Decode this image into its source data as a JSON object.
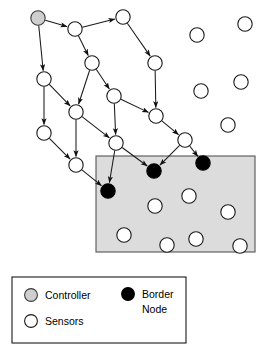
{
  "figure": {
    "background_color": "#ffffff",
    "stroke_color": "#1a1a1a"
  },
  "region": {
    "name": "monitored-region",
    "fill": "#dcdcdc",
    "stroke": "#555555",
    "x": 96,
    "y": 156,
    "width": 159,
    "height": 96
  },
  "node_style": {
    "controller_fill": "#cfcfcf",
    "sensor_fill": "#ffffff",
    "border_node_fill": "#000000",
    "radius": 7.2
  },
  "nodes": [
    {
      "id": "c1",
      "type": "controller",
      "x": 38,
      "y": 18
    },
    {
      "id": "n1",
      "type": "sensor",
      "x": 75,
      "y": 29
    },
    {
      "id": "n2",
      "type": "sensor",
      "x": 123,
      "y": 17
    },
    {
      "id": "n3",
      "type": "sensor",
      "x": 92,
      "y": 63
    },
    {
      "id": "n4",
      "type": "sensor",
      "x": 155,
      "y": 63
    },
    {
      "id": "n5",
      "type": "sensor",
      "x": 44,
      "y": 79
    },
    {
      "id": "n6",
      "type": "sensor",
      "x": 114,
      "y": 96
    },
    {
      "id": "n7",
      "type": "sensor",
      "x": 76,
      "y": 112
    },
    {
      "id": "n8",
      "type": "sensor",
      "x": 156,
      "y": 116
    },
    {
      "id": "n9",
      "type": "sensor",
      "x": 44,
      "y": 133
    },
    {
      "id": "n10",
      "type": "sensor",
      "x": 116,
      "y": 143
    },
    {
      "id": "n11",
      "type": "sensor",
      "x": 185,
      "y": 140
    },
    {
      "id": "n12",
      "type": "sensor",
      "x": 76,
      "y": 165
    },
    {
      "id": "b1",
      "type": "border",
      "x": 108,
      "y": 191
    },
    {
      "id": "b2",
      "type": "border",
      "x": 154,
      "y": 171
    },
    {
      "id": "b3",
      "type": "border",
      "x": 203,
      "y": 163
    },
    {
      "id": "s1",
      "type": "sensor",
      "x": 197,
      "y": 35
    },
    {
      "id": "s2",
      "type": "sensor",
      "x": 245,
      "y": 24
    },
    {
      "id": "s3",
      "type": "sensor",
      "x": 201,
      "y": 91
    },
    {
      "id": "s4",
      "type": "sensor",
      "x": 241,
      "y": 82
    },
    {
      "id": "s5",
      "type": "sensor",
      "x": 228,
      "y": 125
    },
    {
      "id": "s6",
      "type": "sensor",
      "x": 189,
      "y": 196
    },
    {
      "id": "s7",
      "type": "sensor",
      "x": 155,
      "y": 206
    },
    {
      "id": "s8",
      "type": "sensor",
      "x": 228,
      "y": 212
    },
    {
      "id": "s9",
      "type": "sensor",
      "x": 124,
      "y": 235
    },
    {
      "id": "s10",
      "type": "sensor",
      "x": 167,
      "y": 245
    },
    {
      "id": "s11",
      "type": "sensor",
      "x": 196,
      "y": 239
    },
    {
      "id": "s12",
      "type": "sensor",
      "x": 240,
      "y": 246
    }
  ],
  "edges": [
    {
      "from": "c1",
      "to": "n1"
    },
    {
      "from": "c1",
      "to": "n5"
    },
    {
      "from": "n1",
      "to": "n2"
    },
    {
      "from": "n1",
      "to": "n3"
    },
    {
      "from": "n2",
      "to": "n4"
    },
    {
      "from": "n3",
      "to": "n6"
    },
    {
      "from": "n3",
      "to": "n7"
    },
    {
      "from": "n4",
      "to": "n8"
    },
    {
      "from": "n5",
      "to": "n7"
    },
    {
      "from": "n5",
      "to": "n9"
    },
    {
      "from": "n6",
      "to": "n8"
    },
    {
      "from": "n6",
      "to": "n10"
    },
    {
      "from": "n7",
      "to": "n12"
    },
    {
      "from": "n7",
      "to": "n10"
    },
    {
      "from": "n8",
      "to": "n11"
    },
    {
      "from": "n9",
      "to": "n12"
    },
    {
      "from": "n10",
      "to": "b1"
    },
    {
      "from": "n10",
      "to": "b2"
    },
    {
      "from": "n11",
      "to": "b2"
    },
    {
      "from": "n11",
      "to": "b3"
    },
    {
      "from": "n12",
      "to": "b1"
    }
  ],
  "legend": {
    "box": {
      "x": 12,
      "y": 277,
      "width": 174,
      "height": 66
    },
    "items": [
      {
        "key": "controller",
        "label": "Controller",
        "swatch": "controller-swatch",
        "lines": [
          "Controller"
        ]
      },
      {
        "key": "sensors",
        "label": "Sensors",
        "swatch": "sensor-swatch",
        "lines": [
          "Sensors"
        ]
      },
      {
        "key": "border_node",
        "label": "Border Node",
        "swatch": "border-swatch",
        "lines": [
          "Border",
          "Node"
        ]
      }
    ]
  }
}
